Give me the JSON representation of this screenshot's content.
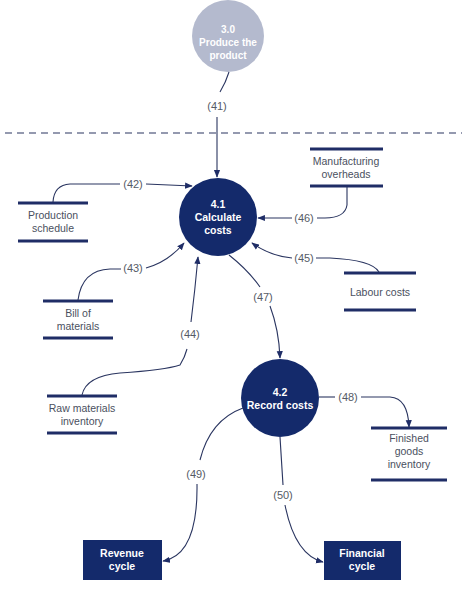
{
  "colors": {
    "process": "#142a6b",
    "external_process": "#b4bace",
    "external_entity": "#142a6b",
    "flow_line": "#2a3560",
    "store_line": "#1f2d66",
    "boundary": "#2a3560"
  },
  "processes": {
    "p30": {
      "id": "3.0",
      "name_line1": "Produce the",
      "name_line2": "product"
    },
    "p41": {
      "id": "4.1",
      "name_line1": "Calculate",
      "name_line2": "costs"
    },
    "p42": {
      "id": "4.2",
      "name_line1": "Record costs"
    }
  },
  "data_stores": {
    "production_schedule": {
      "line1": "Production",
      "line2": "schedule"
    },
    "manufacturing_overheads": {
      "line1": "Manufacturing",
      "line2": "overheads"
    },
    "bill_of_materials": {
      "line1": "Bill of",
      "line2": "materials"
    },
    "labour_costs": {
      "line1": "Labour costs"
    },
    "raw_materials_inventory": {
      "line1": "Raw materials",
      "line2": "inventory"
    },
    "finished_goods_inventory": {
      "line1": "Finished",
      "line2": "goods",
      "line3": "inventory"
    }
  },
  "external_entities": {
    "revenue_cycle": {
      "line1": "Revenue",
      "line2": "cycle"
    },
    "financial_cycle": {
      "line1": "Financial",
      "line2": "cycle"
    }
  },
  "flows": {
    "f41": "(41)",
    "f42": "(42)",
    "f43": "(43)",
    "f44": "(44)",
    "f45": "(45)",
    "f46": "(46)",
    "f47": "(47)",
    "f48": "(48)",
    "f49": "(49)",
    "f50": "(50)"
  }
}
